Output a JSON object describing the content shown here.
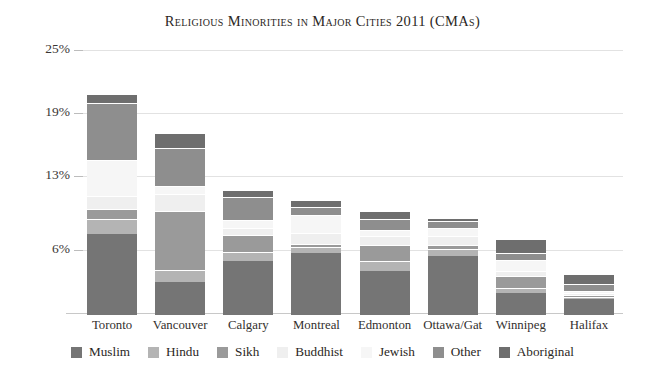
{
  "chart_data": {
    "type": "bar",
    "subtype": "stacked-vertical",
    "title": "Religious Minorities in Major Cities 2011 (CMAs)",
    "xlabel": "",
    "ylabel": "",
    "ylim": [
      0,
      25
    ],
    "grid": true,
    "legend_position": "bottom",
    "ytick_labels": [
      "25%",
      "19%",
      "13%",
      "6%"
    ],
    "ytick_values": [
      25,
      19,
      13,
      6
    ],
    "categories": [
      "Toronto",
      "Vancouver",
      "Calgary",
      "Montreal",
      "Edmonton",
      "Ottawa/Gat",
      "Winnipeg",
      "Halifax"
    ],
    "series": [
      {
        "name": "Muslim",
        "color": "#757575",
        "values": [
          7.7,
          3.1,
          5.1,
          5.9,
          4.2,
          5.6,
          2.1,
          1.5
        ]
      },
      {
        "name": "Hindu",
        "color": "#b4b4b4",
        "values": [
          1.4,
          1.2,
          0.9,
          0.6,
          0.9,
          0.7,
          0.5,
          0.2
        ]
      },
      {
        "name": "Sikh",
        "color": "#9a9a9a",
        "values": [
          1.0,
          5.6,
          1.6,
          0.3,
          1.6,
          0.4,
          1.1,
          0.2
        ]
      },
      {
        "name": "Buddhist",
        "color": "#efefef",
        "values": [
          1.2,
          1.6,
          0.7,
          1.0,
          0.8,
          0.8,
          0.5,
          0.2
        ]
      },
      {
        "name": "Jewish",
        "color": "#f6f6f6",
        "values": [
          3.4,
          0.8,
          0.7,
          1.7,
          0.6,
          0.8,
          1.0,
          0.2
        ]
      },
      {
        "name": "Other",
        "color": "#8e8e8e",
        "values": [
          5.5,
          3.6,
          2.2,
          0.8,
          1.0,
          0.6,
          0.7,
          0.7
        ]
      },
      {
        "name": "Aboriginal",
        "color": "#6e6e6e",
        "values": [
          0.8,
          1.4,
          0.7,
          0.6,
          0.8,
          0.3,
          1.3,
          0.9
        ]
      }
    ],
    "totals": [
      21.0,
      17.3,
      11.9,
      10.9,
      9.9,
      9.2,
      7.2,
      3.9
    ]
  },
  "legend": {
    "items": [
      {
        "label": "Muslim"
      },
      {
        "label": "Hindu"
      },
      {
        "label": "Sikh"
      },
      {
        "label": "Buddhist"
      },
      {
        "label": "Jewish"
      },
      {
        "label": "Other"
      },
      {
        "label": "Aboriginal"
      }
    ]
  }
}
